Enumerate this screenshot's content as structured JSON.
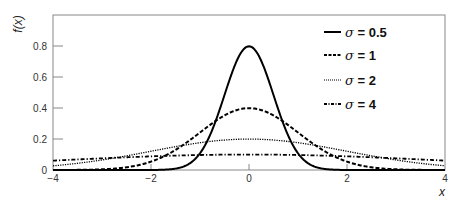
{
  "chart_data": {
    "type": "line",
    "title": "",
    "xlabel": "x",
    "ylabel": "f(x)",
    "xlim": [
      -4,
      4
    ],
    "ylim": [
      0,
      0.9
    ],
    "grid": false,
    "legend_position": "upper right",
    "x_ticks": [
      -4,
      -2,
      0,
      2,
      4
    ],
    "x_tick_labels": [
      "−4",
      "−2",
      "0",
      "2",
      "4"
    ],
    "y_ticks": [
      0,
      0.2,
      0.4,
      0.6,
      0.8
    ],
    "y_tick_labels": [
      "0",
      "0.2",
      "0.4",
      "0.6",
      "0.8"
    ],
    "x": [
      -4,
      -3.5,
      -3,
      -2.5,
      -2,
      -1.5,
      -1,
      -0.5,
      0,
      0.5,
      1,
      1.5,
      2,
      2.5,
      3,
      3.5,
      4
    ],
    "series": [
      {
        "name": "σ = 0.5",
        "sigma": 0.5,
        "style": "solid",
        "values": [
          0.0,
          0.0,
          0.0,
          0.0,
          0.0001,
          0.0089,
          0.108,
          0.484,
          0.798,
          0.484,
          0.108,
          0.0089,
          0.0001,
          0.0,
          0.0,
          0.0,
          0.0
        ]
      },
      {
        "name": "σ = 1",
        "sigma": 1,
        "style": "dashed",
        "values": [
          0.0001,
          0.0009,
          0.0044,
          0.0175,
          0.054,
          0.1295,
          0.242,
          0.352,
          0.399,
          0.352,
          0.242,
          0.1295,
          0.054,
          0.0175,
          0.0044,
          0.0009,
          0.0001
        ]
      },
      {
        "name": "σ = 2",
        "sigma": 2,
        "style": "dotted",
        "values": [
          0.027,
          0.043,
          0.065,
          0.091,
          0.121,
          0.151,
          0.176,
          0.193,
          0.199,
          0.193,
          0.176,
          0.151,
          0.121,
          0.091,
          0.065,
          0.043,
          0.027
        ]
      },
      {
        "name": "σ = 4",
        "sigma": 4,
        "style": "dash-dot",
        "values": [
          0.0605,
          0.068,
          0.0753,
          0.082,
          0.088,
          0.0929,
          0.0967,
          0.0989,
          0.0997,
          0.0989,
          0.0967,
          0.0929,
          0.088,
          0.082,
          0.0753,
          0.068,
          0.0605
        ]
      }
    ]
  },
  "legend": {
    "items": [
      {
        "sigma_symbol": "σ",
        "label": " = 0.5"
      },
      {
        "sigma_symbol": "σ",
        "label": " = 1"
      },
      {
        "sigma_symbol": "σ",
        "label": " = 2"
      },
      {
        "sigma_symbol": "σ",
        "label": " = 4"
      }
    ]
  },
  "axes": {
    "xlabel": "x",
    "ylabel": "f(x)",
    "x_tick_labels": [
      "−4",
      "−2",
      "0",
      "2",
      "4"
    ],
    "y_tick_labels": [
      "0",
      "0.2",
      "0.4",
      "0.6",
      "0.8"
    ]
  }
}
